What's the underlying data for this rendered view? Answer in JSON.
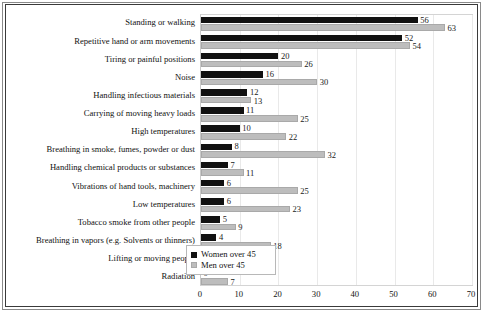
{
  "chart_data": {
    "type": "bar",
    "orientation": "horizontal",
    "title": "",
    "subtitle": "",
    "xlabel": "",
    "ylabel": "",
    "xlim": [
      0,
      70
    ],
    "xticks": [
      "0",
      "10",
      "20",
      "30",
      "40",
      "50",
      "60",
      "70"
    ],
    "grid": "vertical",
    "legend_position": "bottom-right",
    "categories": [
      "Standing or walking",
      "Repetitive hand or arm  movements",
      "Tiring or painful positions",
      "Noise",
      "Handling infectious materials",
      "Carrying of moving  heavy loads",
      "High temperatures",
      "Breathing in smoke, fumes, powder or dust",
      "Handling chemical products or substances",
      "Vibrations of hand tools, machinery",
      "Low temperatures",
      "Tobacco smoke from other people",
      "Breathing in vapors (e.g. Solvents or thinners)",
      "Lifting or moving people",
      "Radiation"
    ],
    "series": [
      {
        "name": "Women over 45",
        "color": "#111111",
        "values": [
          56,
          52,
          20,
          16,
          12,
          11,
          10,
          8,
          7,
          6,
          6,
          5,
          4,
          4,
          0
        ]
      },
      {
        "name": "Men over 45",
        "color": "#bdbdbd",
        "values": [
          63,
          54,
          26,
          30,
          13,
          25,
          22,
          32,
          11,
          25,
          23,
          9,
          18,
          5,
          7
        ]
      }
    ]
  },
  "legend": {
    "items": [
      {
        "label": "Women over 45",
        "swatch": "women"
      },
      {
        "label": "Men over 45",
        "swatch": "men"
      }
    ]
  }
}
